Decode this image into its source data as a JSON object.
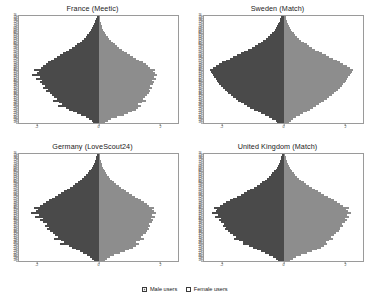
{
  "legend": {
    "male_label": "Male users",
    "female_label": "Female users",
    "male_color": "#6f6f6f",
    "female_color": "#ffffff"
  },
  "axis": {
    "y_ticks": [
      18,
      19,
      20,
      21,
      22,
      23,
      24,
      25,
      26,
      27,
      28,
      29,
      30,
      31,
      32,
      33,
      34,
      35,
      36,
      37,
      38,
      39,
      40,
      41,
      42,
      43,
      44,
      45,
      46,
      47,
      48,
      49,
      50,
      51,
      52,
      53,
      54,
      55,
      56,
      57,
      58,
      59,
      60,
      61,
      62,
      63,
      64,
      65,
      66,
      67,
      68,
      69,
      70,
      71,
      72,
      73,
      74,
      75,
      76
    ],
    "x_ticks": [
      "-2",
      "0",
      "2"
    ],
    "x_tick_values": [
      -2,
      0,
      2
    ],
    "xlim": [
      -2.6,
      2.6
    ],
    "ylim": [
      17.5,
      76.5
    ]
  },
  "chart_data": [
    {
      "type": "bar",
      "title": "France (Meetic)",
      "xlabel": "",
      "ylabel": "",
      "orientation": "population-pyramid",
      "xlim": [
        -2.6,
        2.6
      ],
      "ylim": [
        17.5,
        76.5
      ],
      "grid": false,
      "legend_position": "bottom",
      "categories": [
        18,
        19,
        20,
        21,
        22,
        23,
        24,
        25,
        26,
        27,
        28,
        29,
        30,
        31,
        32,
        33,
        34,
        35,
        36,
        37,
        38,
        39,
        40,
        41,
        42,
        43,
        44,
        45,
        46,
        47,
        48,
        49,
        50,
        51,
        52,
        53,
        54,
        55,
        56,
        57,
        58,
        59,
        60,
        61,
        62,
        63,
        64,
        65,
        66,
        67,
        68,
        69,
        70,
        71,
        72,
        73,
        74,
        75,
        76
      ],
      "series": [
        {
          "name": "Male users",
          "values": [
            -0.18,
            -0.22,
            -0.3,
            -0.42,
            -0.58,
            -0.7,
            -0.82,
            -0.95,
            -1.05,
            -1.32,
            -1.18,
            -1.3,
            -1.48,
            -1.36,
            -1.45,
            -1.52,
            -1.6,
            -1.72,
            -1.66,
            -1.8,
            -1.75,
            -1.86,
            -1.92,
            -1.84,
            -2.05,
            -1.9,
            -2.18,
            -2.02,
            -1.96,
            -2.1,
            -1.88,
            -1.8,
            -1.72,
            -1.64,
            -1.55,
            -1.46,
            -1.36,
            -1.26,
            -1.16,
            -1.06,
            -0.96,
            -0.88,
            -0.78,
            -0.7,
            -0.62,
            -0.55,
            -0.48,
            -0.42,
            -0.36,
            -0.31,
            -0.27,
            -0.23,
            -0.2,
            -0.17,
            -0.14,
            -0.12,
            -0.1,
            -0.08,
            -0.06
          ]
        },
        {
          "name": "Female users",
          "values": [
            0.22,
            0.3,
            0.42,
            0.6,
            0.82,
            0.98,
            1.1,
            1.22,
            1.3,
            1.38,
            1.3,
            1.42,
            1.54,
            1.46,
            1.52,
            1.58,
            1.64,
            1.7,
            1.66,
            1.74,
            1.7,
            1.78,
            1.82,
            1.76,
            1.88,
            1.8,
            1.92,
            1.84,
            1.78,
            1.86,
            1.7,
            1.62,
            1.54,
            1.44,
            1.34,
            1.24,
            1.14,
            1.04,
            0.94,
            0.84,
            0.76,
            0.68,
            0.6,
            0.53,
            0.46,
            0.4,
            0.35,
            0.3,
            0.26,
            0.22,
            0.19,
            0.16,
            0.13,
            0.11,
            0.09,
            0.08,
            0.06,
            0.05,
            0.04
          ]
        }
      ]
    },
    {
      "type": "bar",
      "title": "Sweden (Match)",
      "xlabel": "",
      "ylabel": "",
      "orientation": "population-pyramid",
      "xlim": [
        -2.6,
        2.6
      ],
      "ylim": [
        17.5,
        76.5
      ],
      "grid": false,
      "legend_position": "bottom",
      "categories": [
        18,
        19,
        20,
        21,
        22,
        23,
        24,
        25,
        26,
        27,
        28,
        29,
        30,
        31,
        32,
        33,
        34,
        35,
        36,
        37,
        38,
        39,
        40,
        41,
        42,
        43,
        44,
        45,
        46,
        47,
        48,
        49,
        50,
        51,
        52,
        53,
        54,
        55,
        56,
        57,
        58,
        59,
        60,
        61,
        62,
        63,
        64,
        65,
        66,
        67,
        68,
        69,
        70,
        71,
        72,
        73,
        74,
        75,
        76
      ],
      "series": [
        {
          "name": "Male users",
          "values": [
            -0.2,
            -0.26,
            -0.36,
            -0.48,
            -0.6,
            -0.72,
            -0.84,
            -0.96,
            -1.08,
            -1.18,
            -1.28,
            -1.38,
            -1.48,
            -1.56,
            -1.64,
            -1.72,
            -1.8,
            -1.86,
            -1.92,
            -1.98,
            -2.04,
            -2.1,
            -2.14,
            -2.18,
            -2.22,
            -2.26,
            -2.3,
            -2.34,
            -2.38,
            -2.4,
            -2.3,
            -2.2,
            -2.1,
            -2.0,
            -1.88,
            -1.76,
            -1.64,
            -1.52,
            -1.4,
            -1.28,
            -1.16,
            -1.04,
            -0.94,
            -0.84,
            -0.74,
            -0.66,
            -0.58,
            -0.5,
            -0.44,
            -0.38,
            -0.32,
            -0.28,
            -0.24,
            -0.2,
            -0.17,
            -0.14,
            -0.12,
            -0.1,
            -0.08
          ]
        },
        {
          "name": "Female users",
          "values": [
            0.18,
            0.24,
            0.32,
            0.42,
            0.54,
            0.64,
            0.76,
            0.86,
            0.96,
            1.06,
            1.16,
            1.24,
            1.34,
            1.42,
            1.5,
            1.58,
            1.66,
            1.72,
            1.78,
            1.84,
            1.9,
            1.96,
            2.0,
            2.04,
            2.08,
            2.12,
            2.16,
            2.2,
            2.24,
            2.26,
            2.16,
            2.06,
            1.96,
            1.86,
            1.74,
            1.62,
            1.5,
            1.38,
            1.26,
            1.16,
            1.04,
            0.94,
            0.84,
            0.76,
            0.66,
            0.58,
            0.52,
            0.45,
            0.39,
            0.34,
            0.29,
            0.25,
            0.21,
            0.18,
            0.15,
            0.13,
            0.11,
            0.09,
            0.07
          ]
        }
      ]
    },
    {
      "type": "bar",
      "title": "Germany (LoveScout24)",
      "xlabel": "",
      "ylabel": "",
      "orientation": "population-pyramid",
      "xlim": [
        -2.6,
        2.6
      ],
      "ylim": [
        17.5,
        76.5
      ],
      "grid": false,
      "legend_position": "bottom",
      "categories": [
        18,
        19,
        20,
        21,
        22,
        23,
        24,
        25,
        26,
        27,
        28,
        29,
        30,
        31,
        32,
        33,
        34,
        35,
        36,
        37,
        38,
        39,
        40,
        41,
        42,
        43,
        44,
        45,
        46,
        47,
        48,
        49,
        50,
        51,
        52,
        53,
        54,
        55,
        56,
        57,
        58,
        59,
        60,
        61,
        62,
        63,
        64,
        65,
        66,
        67,
        68,
        69,
        70,
        71,
        72,
        73,
        74,
        75,
        76
      ],
      "series": [
        {
          "name": "Male users",
          "values": [
            -0.16,
            -0.2,
            -0.28,
            -0.38,
            -0.5,
            -0.62,
            -0.74,
            -0.86,
            -0.98,
            -1.26,
            -1.14,
            -1.24,
            -1.44,
            -1.34,
            -1.42,
            -1.5,
            -1.58,
            -1.68,
            -1.62,
            -1.76,
            -1.7,
            -1.82,
            -1.9,
            -1.8,
            -2.08,
            -1.94,
            -2.22,
            -2.06,
            -1.98,
            -2.12,
            -1.92,
            -1.82,
            -1.72,
            -1.62,
            -1.52,
            -1.42,
            -1.32,
            -1.22,
            -1.12,
            -1.02,
            -0.92,
            -0.84,
            -0.76,
            -0.68,
            -0.6,
            -0.53,
            -0.46,
            -0.4,
            -0.35,
            -0.3,
            -0.26,
            -0.22,
            -0.19,
            -0.16,
            -0.13,
            -0.11,
            -0.09,
            -0.07,
            -0.06
          ]
        },
        {
          "name": "Female users",
          "values": [
            0.2,
            0.28,
            0.38,
            0.52,
            0.7,
            0.86,
            1.0,
            1.12,
            1.22,
            1.32,
            1.24,
            1.36,
            1.48,
            1.4,
            1.46,
            1.54,
            1.6,
            1.66,
            1.62,
            1.7,
            1.66,
            1.74,
            1.78,
            1.72,
            1.84,
            1.76,
            1.88,
            1.8,
            1.74,
            1.82,
            1.66,
            1.58,
            1.48,
            1.4,
            1.3,
            1.2,
            1.1,
            1.0,
            0.9,
            0.82,
            0.74,
            0.66,
            0.58,
            0.51,
            0.45,
            0.39,
            0.34,
            0.29,
            0.25,
            0.21,
            0.18,
            0.15,
            0.13,
            0.11,
            0.09,
            0.07,
            0.06,
            0.05,
            0.04
          ]
        }
      ]
    },
    {
      "type": "bar",
      "title": "United Kingdom (Match)",
      "xlabel": "",
      "ylabel": "",
      "orientation": "population-pyramid",
      "xlim": [
        -2.6,
        2.6
      ],
      "ylim": [
        17.5,
        76.5
      ],
      "grid": false,
      "legend_position": "bottom",
      "categories": [
        18,
        19,
        20,
        21,
        22,
        23,
        24,
        25,
        26,
        27,
        28,
        29,
        30,
        31,
        32,
        33,
        34,
        35,
        36,
        37,
        38,
        39,
        40,
        41,
        42,
        43,
        44,
        45,
        46,
        47,
        48,
        49,
        50,
        51,
        52,
        53,
        54,
        55,
        56,
        57,
        58,
        59,
        60,
        61,
        62,
        63,
        64,
        65,
        66,
        67,
        68,
        69,
        70,
        71,
        72,
        73,
        74,
        75,
        76
      ],
      "series": [
        {
          "name": "Male users",
          "values": [
            -0.18,
            -0.24,
            -0.34,
            -0.46,
            -0.6,
            -0.74,
            -0.88,
            -1.0,
            -1.14,
            -1.34,
            -1.34,
            -1.46,
            -1.62,
            -1.56,
            -1.66,
            -1.74,
            -1.82,
            -1.9,
            -1.88,
            -1.98,
            -1.96,
            -2.06,
            -2.12,
            -2.06,
            -2.24,
            -2.14,
            -2.34,
            -2.22,
            -2.16,
            -2.26,
            -2.08,
            -1.98,
            -1.88,
            -1.76,
            -1.64,
            -1.52,
            -1.4,
            -1.3,
            -1.18,
            -1.08,
            -0.98,
            -0.88,
            -0.78,
            -0.7,
            -0.62,
            -0.54,
            -0.48,
            -0.42,
            -0.36,
            -0.31,
            -0.26,
            -0.22,
            -0.19,
            -0.16,
            -0.13,
            -0.11,
            -0.09,
            -0.08,
            -0.06
          ]
        },
        {
          "name": "Female users",
          "values": [
            0.22,
            0.3,
            0.42,
            0.58,
            0.78,
            0.94,
            1.08,
            1.22,
            1.32,
            1.42,
            1.38,
            1.5,
            1.62,
            1.56,
            1.64,
            1.72,
            1.8,
            1.86,
            1.84,
            1.94,
            1.9,
            2.0,
            2.06,
            2.0,
            2.14,
            2.06,
            2.2,
            2.1,
            2.04,
            2.14,
            1.96,
            1.86,
            1.76,
            1.66,
            1.54,
            1.44,
            1.32,
            1.22,
            1.12,
            1.02,
            0.92,
            0.82,
            0.74,
            0.66,
            0.58,
            0.51,
            0.44,
            0.38,
            0.33,
            0.28,
            0.24,
            0.21,
            0.17,
            0.15,
            0.12,
            0.1,
            0.08,
            0.07,
            0.05
          ]
        }
      ]
    }
  ]
}
